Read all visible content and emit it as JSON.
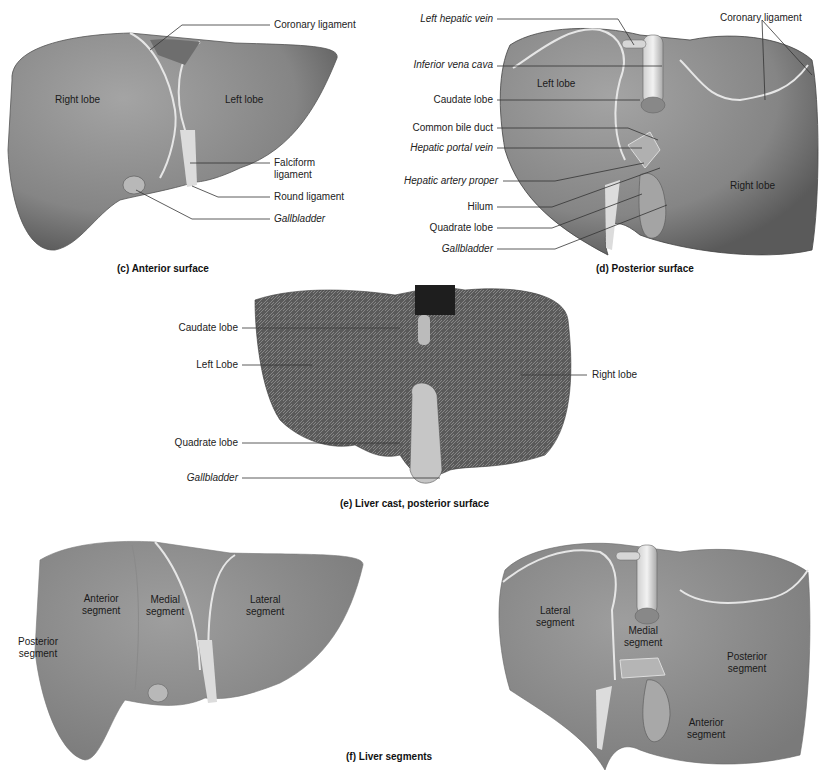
{
  "panels": {
    "c": {
      "caption": "(c) Anterior surface",
      "regions": {
        "right_lobe": "Right lobe",
        "left_lobe": "Left lobe"
      },
      "labels": [
        {
          "text": "Coronary ligament",
          "italic": false
        },
        {
          "text": "Falciform",
          "italic": false
        },
        {
          "text": "ligament",
          "italic": false
        },
        {
          "text": "Round ligament",
          "italic": false
        },
        {
          "text": "Gallbladder",
          "italic": true
        }
      ]
    },
    "d": {
      "caption": "(d) Posterior surface",
      "regions": {
        "left_lobe": "Left lobe",
        "right_lobe": "Right lobe"
      },
      "labels": [
        {
          "text": "Left hepatic vein",
          "italic": true
        },
        {
          "text": "Inferior vena cava",
          "italic": true
        },
        {
          "text": "Caudate lobe",
          "italic": false
        },
        {
          "text": "Common bile duct",
          "italic": false
        },
        {
          "text": "Hepatic portal vein",
          "italic": true
        },
        {
          "text": "Hepatic artery proper",
          "italic": true
        },
        {
          "text": "Hilum",
          "italic": false
        },
        {
          "text": "Quadrate lobe",
          "italic": false
        },
        {
          "text": "Gallbladder",
          "italic": true
        },
        {
          "text": "Coronary ligament",
          "italic": false
        }
      ]
    },
    "e": {
      "caption": "(e) Liver cast, posterior surface",
      "labels": [
        {
          "text": "Caudate lobe",
          "italic": false
        },
        {
          "text": "Left Lobe",
          "italic": false
        },
        {
          "text": "Quadrate lobe",
          "italic": false
        },
        {
          "text": "Gallbladder",
          "italic": true
        },
        {
          "text": "Right lobe",
          "italic": false
        }
      ]
    },
    "f": {
      "caption": "(f) Liver segments",
      "anterior_view": {
        "segments": [
          "Posterior\nsegment",
          "Anterior\nsegment",
          "Medial\nsegment",
          "Lateral\nsegment"
        ]
      },
      "posterior_view": {
        "segments": [
          "Lateral\nsegment",
          "Medial\nsegment",
          "Posterior\nsegment",
          "Anterior\nsegment"
        ]
      }
    }
  },
  "colors": {
    "liver": "#8c8c8c",
    "liver_dark": "#5e5e5e",
    "liver_light": "#a9a9a9",
    "ligament": "#e6e6e6",
    "leader": "#333333",
    "cast": "#6b6b6b",
    "background": "#ffffff"
  }
}
